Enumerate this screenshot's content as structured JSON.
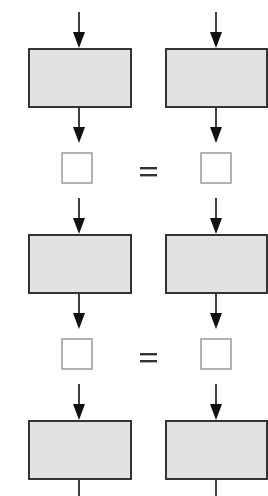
{
  "diagram": {
    "type": "flow-comparison",
    "columns": 2,
    "colors": {
      "box_fill": "#e2e2e2",
      "box_stroke": "#333333",
      "small_box_stroke": "#9a9a9a",
      "arrow": "#111111",
      "equals": "#333333"
    },
    "process_boxes": [
      {
        "id": "left-1",
        "column": "left",
        "row": 1,
        "label": ""
      },
      {
        "id": "right-1",
        "column": "right",
        "row": 1,
        "label": ""
      },
      {
        "id": "left-2",
        "column": "left",
        "row": 2,
        "label": ""
      },
      {
        "id": "right-2",
        "column": "right",
        "row": 2,
        "label": ""
      },
      {
        "id": "left-3",
        "column": "left",
        "row": 3,
        "label": ""
      },
      {
        "id": "right-3",
        "column": "right",
        "row": 3,
        "label": ""
      }
    ],
    "output_boxes": [
      {
        "id": "out-left-1",
        "column": "left",
        "row": 1,
        "value": ""
      },
      {
        "id": "out-right-1",
        "column": "right",
        "row": 1,
        "value": ""
      },
      {
        "id": "out-left-2",
        "column": "left",
        "row": 2,
        "value": ""
      },
      {
        "id": "out-right-2",
        "column": "right",
        "row": 2,
        "value": ""
      }
    ],
    "comparisons": [
      {
        "row": 1,
        "symbol": "="
      },
      {
        "row": 2,
        "symbol": "="
      }
    ]
  }
}
